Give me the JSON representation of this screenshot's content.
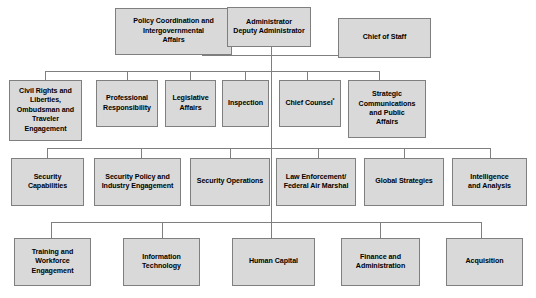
{
  "chart": {
    "type": "org-chart",
    "footnote_marker": "*",
    "colors": {
      "box_fill": "#d9d9d9",
      "box_border": "#7f7f7f",
      "connector": "#7f7f7f",
      "text": "#000000",
      "background": "#ffffff"
    },
    "levels": [
      {
        "level": 1,
        "name": "executive",
        "nodes": [
          {
            "id": "administrator",
            "label": "Administrator\nDeputy Administrator",
            "lines": [
              "Administrator",
              "Deputy Administrator"
            ]
          },
          {
            "id": "chief-of-staff",
            "label": "Chief of Staff",
            "lines": [
              "Chief of Staff"
            ]
          },
          {
            "id": "policy-coordination",
            "label": "Policy Coordination and Intergovernmental Affairs",
            "lines": [
              "Policy Coordination and",
              "Intergovernmental",
              "Affairs"
            ]
          }
        ]
      },
      {
        "level": 2,
        "name": "staff-offices",
        "nodes": [
          {
            "id": "civil-rights",
            "label": "Civil Rights and Liberties, Ombudsman and Traveler Engagement",
            "lines": [
              "Civil Rights and",
              "Liberties,",
              "Ombudsman and",
              "Traveler",
              "Engagement"
            ]
          },
          {
            "id": "professional-responsibility",
            "label": "Professional Responsibility",
            "lines": [
              "Professional",
              "Responsibility"
            ]
          },
          {
            "id": "legislative-affairs",
            "label": "Legislative Affairs",
            "lines": [
              "Legislative",
              "Affairs"
            ]
          },
          {
            "id": "inspection",
            "label": "Inspection",
            "lines": [
              "Inspection"
            ]
          },
          {
            "id": "chief-counsel",
            "label": "Chief Counsel*",
            "lines": [
              "Chief Counsel*"
            ],
            "has_footnote": true
          },
          {
            "id": "strategic-communications",
            "label": "Strategic Communications and Public Affairs",
            "lines": [
              "Strategic",
              "Communications",
              "and Public",
              "Affairs"
            ]
          }
        ]
      },
      {
        "level": 3,
        "name": "operational-offices",
        "nodes": [
          {
            "id": "security-capabilities",
            "label": "Security Capabilities",
            "lines": [
              "Security",
              "Capabilities"
            ]
          },
          {
            "id": "security-policy",
            "label": "Security Policy and Industry Engagement",
            "lines": [
              "Security Policy and",
              "Industry Engagement"
            ]
          },
          {
            "id": "security-operations",
            "label": "Security Operations",
            "lines": [
              "Security Operations"
            ]
          },
          {
            "id": "law-enforcement",
            "label": "Law Enforcement/ Federal Air Marshal",
            "lines": [
              "Law Enforcement/",
              "Federal Air Marshal"
            ]
          },
          {
            "id": "global-strategies",
            "label": "Global Strategies",
            "lines": [
              "Global Strategies"
            ]
          },
          {
            "id": "intelligence-analysis",
            "label": "Intelligence and Analysis",
            "lines": [
              "Intelligence",
              "and Analysis"
            ]
          }
        ]
      },
      {
        "level": 4,
        "name": "support-offices",
        "nodes": [
          {
            "id": "training-workforce",
            "label": "Training and Workforce Engagement",
            "lines": [
              "Training and",
              "Workforce",
              "Engagement"
            ]
          },
          {
            "id": "information-technology",
            "label": "Information Technology",
            "lines": [
              "Information",
              "Technology"
            ]
          },
          {
            "id": "human-capital",
            "label": "Human Capital",
            "lines": [
              "Human Capital"
            ]
          },
          {
            "id": "finance-administration",
            "label": "Finance and Administration",
            "lines": [
              "Finance and",
              "Administration"
            ]
          },
          {
            "id": "acquisition",
            "label": "Acquisition",
            "lines": [
              "Acquisition"
            ]
          }
        ]
      }
    ]
  }
}
